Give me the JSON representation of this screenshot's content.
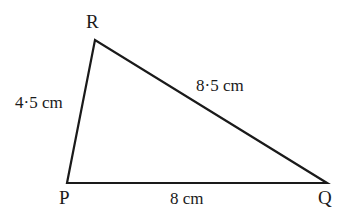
{
  "diagram": {
    "type": "triangle",
    "vertices": {
      "P": {
        "label": "P"
      },
      "Q": {
        "label": "Q"
      },
      "R": {
        "label": "R"
      }
    },
    "sides": {
      "PR": {
        "label": "4·5 cm"
      },
      "RQ": {
        "label": "8·5 cm"
      },
      "PQ": {
        "label": "8 cm"
      }
    },
    "colors": {
      "stroke": "#1a1a1a",
      "background": "#ffffff"
    }
  }
}
